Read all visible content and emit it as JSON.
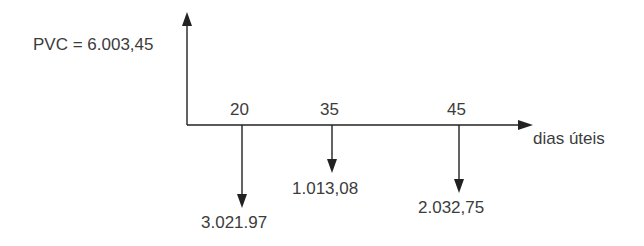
{
  "diagram": {
    "type": "cash-flow",
    "present_value_label": "PVC = 6.003,45",
    "axis_label": "dias úteis",
    "ticks": [
      {
        "day": "20",
        "amount": "3.021.97",
        "x": 242,
        "arrow_end_y": 207
      },
      {
        "day": "35",
        "amount": "1.013,08",
        "x": 332,
        "arrow_end_y": 172
      },
      {
        "day": "45",
        "amount": "2.032,75",
        "x": 459,
        "arrow_end_y": 192
      }
    ],
    "colors": {
      "line": "#222222",
      "text": "#3c3c3c"
    }
  }
}
